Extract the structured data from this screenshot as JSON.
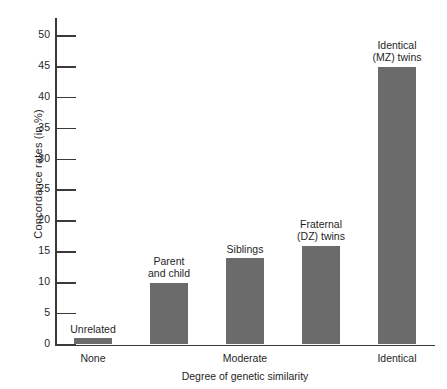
{
  "chart_data": {
    "type": "bar",
    "title": "",
    "xlabel": "Degree of genetic similarity",
    "ylabel": "Concordance rates (in %)",
    "ylim": [
      0,
      50
    ],
    "ytick_labels": [
      "0",
      "5",
      "10",
      "15",
      "20",
      "25",
      "30",
      "35",
      "40",
      "45",
      "50"
    ],
    "ytick_values": [
      0,
      5,
      10,
      15,
      20,
      25,
      30,
      35,
      40,
      45,
      50
    ],
    "grid": false,
    "legend": "none",
    "xtick_labels": [
      "None",
      "Moderate",
      "Identical"
    ],
    "categories": [
      "Unrelated",
      "Parent and child",
      "Siblings",
      "Fraternal (DZ) twins",
      "Identical (MZ) twins"
    ],
    "values": [
      1,
      10,
      14,
      16,
      45
    ],
    "bar_captions": [
      "Unrelated",
      "Parent\nand child",
      "Siblings",
      "Fraternal\n(DZ) twins",
      "Identical\n(MZ) twins"
    ],
    "bar_color": "#6b6b6b",
    "axis_color": "#3a3a3a",
    "background_color": "#ffffff"
  }
}
